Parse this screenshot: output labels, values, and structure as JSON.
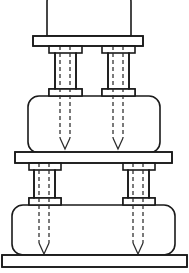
{
  "figure": {
    "drawing_type": "technical-line-drawing",
    "canvas": {
      "width": 189,
      "height": 273
    },
    "background_color": "#ffffff",
    "line_color": "#1a1a1a",
    "hidden_line_color": "#2b2b2b",
    "line_width": 1.6,
    "hidden_line_width": 1.25,
    "hidden_line_dash": "4 3"
  },
  "components": {
    "top_tier": {
      "name": "top-tier-body",
      "shape": "rounded-top-rectangle",
      "x": 47,
      "y": -8,
      "width": 84,
      "height": 44,
      "corner_radius": 10,
      "clipped_at_top": true
    },
    "top_plate": {
      "name": "top-plate",
      "shape": "rectangle",
      "x": 33,
      "y": 36,
      "width": 110,
      "height": 10
    },
    "upper_columns": [
      {
        "name": "upper-column-left",
        "shaft_x": 55,
        "shaft_width": 21,
        "top_y": 46,
        "bottom_y": 96,
        "cap_top": {
          "x": 49,
          "y": 46,
          "width": 33,
          "height": 7
        },
        "cap_bottom": {
          "x": 49,
          "y": 89,
          "width": 33,
          "height": 7
        }
      },
      {
        "name": "upper-column-right",
        "shaft_x": 108,
        "shaft_width": 21,
        "top_y": 46,
        "bottom_y": 96,
        "cap_top": {
          "x": 102,
          "y": 46,
          "width": 33,
          "height": 7
        },
        "cap_bottom": {
          "x": 102,
          "y": 89,
          "width": 33,
          "height": 7
        }
      }
    ],
    "middle_tier": {
      "name": "middle-tier-body",
      "shape": "rounded-rectangle",
      "x": 28,
      "y": 96,
      "width": 132,
      "height": 57,
      "corner_radius": 11
    },
    "middle_plate": {
      "name": "middle-plate",
      "shape": "rectangle",
      "x": 15,
      "y": 152,
      "width": 157,
      "height": 11
    },
    "lower_columns": [
      {
        "name": "lower-column-left",
        "shaft_x": 34,
        "shaft_width": 21,
        "top_y": 163,
        "bottom_y": 205,
        "cap_top": {
          "x": 29,
          "y": 163,
          "width": 32,
          "height": 7
        },
        "cap_bottom": {
          "x": 29,
          "y": 198,
          "width": 32,
          "height": 7
        }
      },
      {
        "name": "lower-column-right",
        "shaft_x": 128,
        "shaft_width": 21,
        "top_y": 163,
        "bottom_y": 205,
        "cap_top": {
          "x": 123,
          "y": 163,
          "width": 32,
          "height": 7
        },
        "cap_bottom": {
          "x": 123,
          "y": 198,
          "width": 32,
          "height": 7
        }
      }
    ],
    "bottom_tier": {
      "name": "bottom-tier-body",
      "shape": "rounded-rectangle",
      "x": 12,
      "y": 205,
      "width": 163,
      "height": 50,
      "corner_radius": 11
    },
    "base_plate": {
      "name": "base-plate",
      "shape": "rectangle",
      "x": 2,
      "y": 255,
      "width": 185,
      "height": 12
    }
  },
  "hidden_fasteners": [
    {
      "name": "bolt-upper-left",
      "left_x": 60,
      "right_x": 70,
      "start_y": 46,
      "shaft_end_y": 138,
      "tip_y": 149,
      "through_column": "upper-column-left",
      "terminates_in": "middle-tier-body"
    },
    {
      "name": "bolt-upper-right",
      "left_x": 113,
      "right_x": 123,
      "start_y": 46,
      "shaft_end_y": 138,
      "tip_y": 149,
      "through_column": "upper-column-right",
      "terminates_in": "middle-tier-body"
    },
    {
      "name": "bolt-lower-left",
      "left_x": 39,
      "right_x": 49,
      "start_y": 163,
      "shaft_end_y": 243,
      "tip_y": 254,
      "through_column": "lower-column-left",
      "terminates_in": "bottom-tier-body"
    },
    {
      "name": "bolt-lower-right",
      "left_x": 133,
      "right_x": 143,
      "start_y": 163,
      "shaft_end_y": 243,
      "tip_y": 254,
      "through_column": "lower-column-right",
      "terminates_in": "bottom-tier-body"
    }
  ],
  "column_ribs": [
    {
      "name": "rib-upper-left",
      "x": 55,
      "top_y": 53,
      "bottom_y": 89
    },
    {
      "name": "rib-upper-left-2",
      "x": 76,
      "top_y": 53,
      "bottom_y": 89
    },
    {
      "name": "rib-upper-right",
      "x": 108,
      "top_y": 53,
      "bottom_y": 89
    },
    {
      "name": "rib-upper-right-2",
      "x": 129,
      "top_y": 53,
      "bottom_y": 89
    },
    {
      "name": "rib-lower-left",
      "x": 34,
      "top_y": 170,
      "bottom_y": 198
    },
    {
      "name": "rib-lower-left-2",
      "x": 55,
      "top_y": 170,
      "bottom_y": 198
    },
    {
      "name": "rib-lower-right",
      "x": 128,
      "top_y": 170,
      "bottom_y": 198
    },
    {
      "name": "rib-lower-right-2",
      "x": 149,
      "top_y": 170,
      "bottom_y": 198
    }
  ]
}
